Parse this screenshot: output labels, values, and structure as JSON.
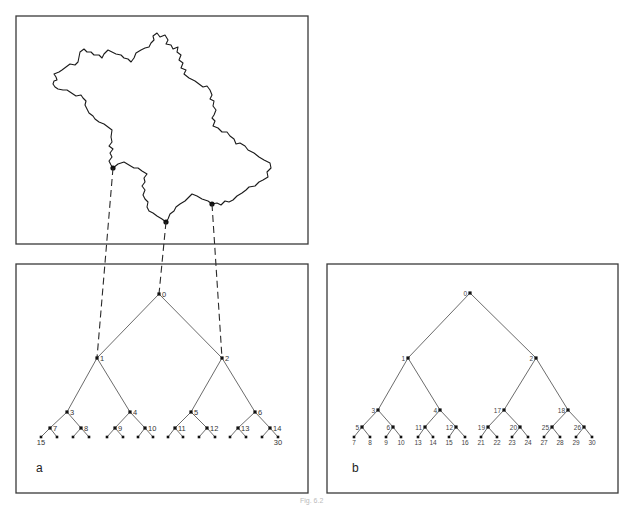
{
  "figure": {
    "caption": "Fig. 6.2",
    "panels": [
      {
        "id": "fractal",
        "frame": {
          "x": 16,
          "y": 16,
          "w": 292,
          "h": 228
        },
        "description": "Fractal (Koch-like) island outline with three marked points",
        "marked_points": [
          {
            "x": 113,
            "y": 168,
            "links_to_node": "1"
          },
          {
            "x": 166,
            "y": 222,
            "links_to_node": "0"
          },
          {
            "x": 212,
            "y": 204,
            "links_to_node": "2"
          }
        ]
      },
      {
        "id": "a",
        "letter": "a",
        "frame": {
          "x": 16,
          "y": 264,
          "w": 292,
          "h": 229
        },
        "letter_pos": {
          "x": 36,
          "y": 472
        },
        "label_side": "right",
        "numbering": "breadth-first",
        "nodes": [
          {
            "id": "0",
            "x": 159,
            "y": 294,
            "label": "0"
          },
          {
            "id": "1",
            "x": 97,
            "y": 358,
            "label": "1"
          },
          {
            "id": "2",
            "x": 222,
            "y": 358,
            "label": "2"
          },
          {
            "id": "3",
            "x": 67,
            "y": 412,
            "label": "3"
          },
          {
            "id": "4",
            "x": 130,
            "y": 412,
            "label": "4"
          },
          {
            "id": "5",
            "x": 191,
            "y": 412,
            "label": "5"
          },
          {
            "id": "6",
            "x": 255,
            "y": 412,
            "label": "6"
          },
          {
            "id": "7",
            "x": 50,
            "y": 428,
            "label": "7"
          },
          {
            "id": "8",
            "x": 81,
            "y": 428,
            "label": "8"
          },
          {
            "id": "9",
            "x": 115,
            "y": 428,
            "label": "9"
          },
          {
            "id": "10",
            "x": 145,
            "y": 428,
            "label": "10"
          },
          {
            "id": "11",
            "x": 175,
            "y": 428,
            "label": "11"
          },
          {
            "id": "12",
            "x": 207,
            "y": 428,
            "label": "12"
          },
          {
            "id": "13",
            "x": 238,
            "y": 428,
            "label": "13"
          },
          {
            "id": "14",
            "x": 270,
            "y": 428,
            "label": "14"
          },
          {
            "id": "15",
            "x": 41,
            "y": 437,
            "label": "15"
          },
          {
            "id": "16",
            "x": 57,
            "y": 437,
            "label": ""
          },
          {
            "id": "17",
            "x": 73,
            "y": 437,
            "label": ""
          },
          {
            "id": "18",
            "x": 89,
            "y": 437,
            "label": ""
          },
          {
            "id": "19",
            "x": 107,
            "y": 437,
            "label": ""
          },
          {
            "id": "20",
            "x": 123,
            "y": 437,
            "label": ""
          },
          {
            "id": "21",
            "x": 138,
            "y": 437,
            "label": ""
          },
          {
            "id": "22",
            "x": 153,
            "y": 437,
            "label": ""
          },
          {
            "id": "23",
            "x": 168,
            "y": 437,
            "label": ""
          },
          {
            "id": "24",
            "x": 183,
            "y": 437,
            "label": ""
          },
          {
            "id": "25",
            "x": 199,
            "y": 437,
            "label": ""
          },
          {
            "id": "26",
            "x": 215,
            "y": 437,
            "label": ""
          },
          {
            "id": "27",
            "x": 230,
            "y": 437,
            "label": ""
          },
          {
            "id": "28",
            "x": 246,
            "y": 437,
            "label": ""
          },
          {
            "id": "29",
            "x": 262,
            "y": 437,
            "label": ""
          },
          {
            "id": "30",
            "x": 278,
            "y": 437,
            "label": "30"
          }
        ],
        "edges": [
          [
            "0",
            "1"
          ],
          [
            "0",
            "2"
          ],
          [
            "1",
            "3"
          ],
          [
            "1",
            "4"
          ],
          [
            "2",
            "5"
          ],
          [
            "2",
            "6"
          ],
          [
            "3",
            "7"
          ],
          [
            "3",
            "8"
          ],
          [
            "4",
            "9"
          ],
          [
            "4",
            "10"
          ],
          [
            "5",
            "11"
          ],
          [
            "5",
            "12"
          ],
          [
            "6",
            "13"
          ],
          [
            "6",
            "14"
          ],
          [
            "7",
            "15"
          ],
          [
            "7",
            "16"
          ],
          [
            "8",
            "17"
          ],
          [
            "8",
            "18"
          ],
          [
            "9",
            "19"
          ],
          [
            "9",
            "20"
          ],
          [
            "10",
            "21"
          ],
          [
            "10",
            "22"
          ],
          [
            "11",
            "23"
          ],
          [
            "11",
            "24"
          ],
          [
            "12",
            "25"
          ],
          [
            "12",
            "26"
          ],
          [
            "13",
            "27"
          ],
          [
            "13",
            "28"
          ],
          [
            "14",
            "29"
          ],
          [
            "14",
            "30"
          ]
        ]
      },
      {
        "id": "b",
        "letter": "b",
        "frame": {
          "x": 327,
          "y": 264,
          "w": 291,
          "h": 229
        },
        "letter_pos": {
          "x": 352,
          "y": 472
        },
        "label_side": "left",
        "numbering": "depth-first",
        "nodes": [
          {
            "id": "0",
            "x": 470,
            "y": 293,
            "label": "0"
          },
          {
            "id": "1",
            "x": 408,
            "y": 358,
            "label": "1"
          },
          {
            "id": "2",
            "x": 536,
            "y": 358,
            "label": "2"
          },
          {
            "id": "3",
            "x": 378,
            "y": 410,
            "label": "3"
          },
          {
            "id": "4",
            "x": 440,
            "y": 410,
            "label": "4"
          },
          {
            "id": "17",
            "x": 504,
            "y": 410,
            "label": "17"
          },
          {
            "id": "18",
            "x": 568,
            "y": 410,
            "label": "18"
          },
          {
            "id": "5",
            "x": 362,
            "y": 427,
            "label": "5"
          },
          {
            "id": "6",
            "x": 393,
            "y": 427,
            "label": "6"
          },
          {
            "id": "11",
            "x": 425,
            "y": 427,
            "label": "11"
          },
          {
            "id": "12",
            "x": 456,
            "y": 427,
            "label": "12"
          },
          {
            "id": "19",
            "x": 488,
            "y": 427,
            "label": "19"
          },
          {
            "id": "20",
            "x": 520,
            "y": 427,
            "label": "20"
          },
          {
            "id": "25",
            "x": 552,
            "y": 427,
            "label": "25"
          },
          {
            "id": "26",
            "x": 584,
            "y": 427,
            "label": "26"
          },
          {
            "id": "7",
            "x": 354,
            "y": 437,
            "label": "7"
          },
          {
            "id": "8",
            "x": 370,
            "y": 437,
            "label": "8"
          },
          {
            "id": "9",
            "x": 386,
            "y": 437,
            "label": "9"
          },
          {
            "id": "10",
            "x": 401,
            "y": 437,
            "label": "10"
          },
          {
            "id": "13",
            "x": 418,
            "y": 437,
            "label": "13"
          },
          {
            "id": "14",
            "x": 433,
            "y": 437,
            "label": "14"
          },
          {
            "id": "15",
            "x": 449,
            "y": 437,
            "label": "15"
          },
          {
            "id": "16",
            "x": 465,
            "y": 437,
            "label": "16"
          },
          {
            "id": "21",
            "x": 481,
            "y": 437,
            "label": "21"
          },
          {
            "id": "22",
            "x": 497,
            "y": 437,
            "label": "22"
          },
          {
            "id": "23",
            "x": 512,
            "y": 437,
            "label": "23"
          },
          {
            "id": "24",
            "x": 528,
            "y": 437,
            "label": "24"
          },
          {
            "id": "27",
            "x": 544,
            "y": 437,
            "label": "27"
          },
          {
            "id": "28",
            "x": 560,
            "y": 437,
            "label": "28"
          },
          {
            "id": "29",
            "x": 576,
            "y": 437,
            "label": "29"
          },
          {
            "id": "30",
            "x": 592,
            "y": 437,
            "label": "30"
          }
        ],
        "edges": [
          [
            "0",
            "1"
          ],
          [
            "0",
            "2"
          ],
          [
            "1",
            "3"
          ],
          [
            "1",
            "4"
          ],
          [
            "2",
            "17"
          ],
          [
            "2",
            "18"
          ],
          [
            "3",
            "5"
          ],
          [
            "3",
            "6"
          ],
          [
            "4",
            "11"
          ],
          [
            "4",
            "12"
          ],
          [
            "17",
            "19"
          ],
          [
            "17",
            "20"
          ],
          [
            "18",
            "25"
          ],
          [
            "18",
            "26"
          ],
          [
            "5",
            "7"
          ],
          [
            "5",
            "8"
          ],
          [
            "6",
            "9"
          ],
          [
            "6",
            "10"
          ],
          [
            "11",
            "13"
          ],
          [
            "11",
            "14"
          ],
          [
            "12",
            "15"
          ],
          [
            "12",
            "16"
          ],
          [
            "19",
            "21"
          ],
          [
            "19",
            "22"
          ],
          [
            "20",
            "23"
          ],
          [
            "20",
            "24"
          ],
          [
            "25",
            "27"
          ],
          [
            "25",
            "28"
          ],
          [
            "26",
            "29"
          ],
          [
            "26",
            "30"
          ]
        ]
      }
    ],
    "dashed_links": [
      {
        "from": {
          "x": 113,
          "y": 168
        },
        "to": {
          "x": 97,
          "y": 358
        }
      },
      {
        "from": {
          "x": 166,
          "y": 222
        },
        "to": {
          "x": 159,
          "y": 294
        }
      },
      {
        "from": {
          "x": 212,
          "y": 204
        },
        "to": {
          "x": 222,
          "y": 358
        }
      }
    ]
  }
}
